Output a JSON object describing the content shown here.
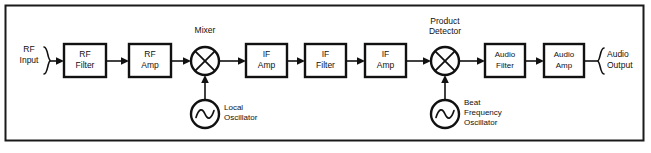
{
  "diagram": {
    "type": "signal-flow-block-diagram",
    "background_color": "#ffffff",
    "line_color": "#111111",
    "frame": {
      "stroke": "#1a1a1a",
      "x": 5,
      "y": 5,
      "width": 639,
      "height": 136
    },
    "terminals": [
      {
        "name": "rf-input",
        "line1": "RF",
        "line2": "Input",
        "side": "left"
      },
      {
        "name": "audio-output",
        "line1": "Audio",
        "line2": "Output",
        "side": "right"
      }
    ],
    "blocks": [
      {
        "name": "rf-filter",
        "line1": "RF",
        "line2": "Filter",
        "x": 64,
        "y": 44,
        "w": 42,
        "h": 33
      },
      {
        "name": "rf-amp",
        "line1": "RF",
        "line2": "Amp",
        "x": 129,
        "y": 44,
        "w": 42,
        "h": 33
      },
      {
        "name": "if-amp-1",
        "line1": "IF",
        "line2": "Amp",
        "x": 246,
        "y": 44,
        "w": 41,
        "h": 33
      },
      {
        "name": "if-filter",
        "line1": "IF",
        "line2": "Filter",
        "x": 305,
        "y": 44,
        "w": 41,
        "h": 33
      },
      {
        "name": "if-amp-2",
        "line1": "IF",
        "line2": "Amp",
        "x": 365,
        "y": 44,
        "w": 41,
        "h": 33
      },
      {
        "name": "audio-filter",
        "line1": "Audio",
        "line2": "Filter",
        "x": 485,
        "y": 44,
        "w": 40,
        "h": 33
      },
      {
        "name": "audio-amp",
        "line1": "Audio",
        "line2": "Amp",
        "x": 544,
        "y": 44,
        "w": 40,
        "h": 33
      }
    ],
    "mixers": [
      {
        "name": "mixer",
        "label_line1": "Mixer",
        "label_line2": "",
        "cx": 205,
        "cy": 61,
        "r": 14
      },
      {
        "name": "product-detector",
        "label_line1": "Product",
        "label_line2": "Detector",
        "cx": 445,
        "cy": 61,
        "r": 14
      }
    ],
    "oscillators": [
      {
        "name": "local-oscillator",
        "label_line1": "Local",
        "label_line2": "Oscillator",
        "label_line3": "",
        "cx": 205,
        "cy": 114,
        "r": 14
      },
      {
        "name": "beat-frequency-oscillator",
        "label_line1": "Beat",
        "label_line2": "Frequency",
        "label_line3": "Oscillator",
        "cx": 445,
        "cy": 114,
        "r": 14
      }
    ],
    "signal_path": [
      "RF Input",
      "RF Filter",
      "RF Amp",
      "Mixer",
      "IF Amp",
      "IF Filter",
      "IF Amp",
      "Product Detector",
      "Audio Filter",
      "Audio Amp",
      "Audio Output"
    ],
    "injection_paths": [
      {
        "from": "Local Oscillator",
        "to": "Mixer"
      },
      {
        "from": "Beat Frequency Oscillator",
        "to": "Product Detector"
      }
    ]
  }
}
